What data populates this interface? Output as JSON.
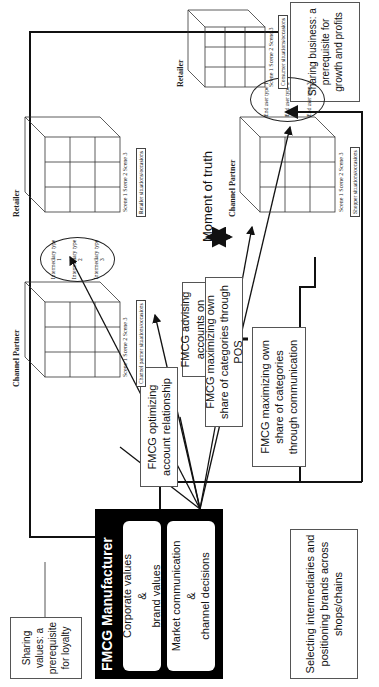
{
  "callouts": {
    "sharing_values": "Sharing values: a prerequisite for loyalty",
    "sharing_business": "Sharing business: a prerequisite for growth and profits"
  },
  "manufacturer": {
    "title": "FMCG Manufacturer",
    "block1": {
      "line1": "Corporate values",
      "line2": "&",
      "line3": "brand values"
    },
    "block2": {
      "line1": "Market communication",
      "line2": "&",
      "line3": "channel decisions"
    }
  },
  "selecting": "Selecting intermediaries and positioning brands across shops/chains",
  "actions": [
    {
      "label": "FMCG optimizing account relationship"
    },
    {
      "label": "FMCG advising accounts on driving categories"
    },
    {
      "label": "FMCG maximizing own share of categories through POS"
    },
    {
      "label": "FMCG maximizing own share of categories through communication"
    }
  ],
  "moment_of_truth": "Moment of truth",
  "upper_cubes": {
    "channel_partner": {
      "title": "Channel Partner",
      "scenes": "Scene 1 Scene 2 Scene 3",
      "roles": [
        "Role 1",
        "Role 2",
        "Role 3"
      ],
      "situation": "Channel partner situations/occasions"
    },
    "intermediaries": [
      "Intermediary type 1",
      "Intermediary type 2",
      "Intermediary type 3"
    ],
    "retailer": {
      "title": "Retailer",
      "scenes": "Scene 1 Scene 2 Scene 3",
      "roles": [
        "Role 1",
        "Role2",
        "Role3"
      ],
      "situation": "Retailer situations/occasions"
    }
  },
  "lower_cubes": {
    "channel_partner": {
      "title": "Channel Partner",
      "scenes": "Scene 1 Scene 2 Scene 3",
      "roles": [
        "Role 1",
        "Role 2",
        "Role 3"
      ],
      "situation": "Shopper situations/occasions"
    },
    "end_users": [
      "End user type 1",
      "End user type 2",
      "End user type 3"
    ],
    "retailer": {
      "title": "Retailer",
      "scenes": "Scene 1 Scene 2 Scene 3",
      "roles": [
        "Role 1",
        "Role2",
        "Role3"
      ],
      "situation": "Consumer situations/occasions"
    }
  },
  "colors": {
    "ink": "#111111",
    "frame": "#000000",
    "box_border": "#555555"
  }
}
